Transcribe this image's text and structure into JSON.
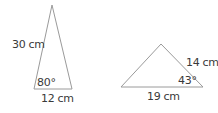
{
  "triangles": [
    {
      "id": "triangle-1",
      "side_label": "30 cm",
      "base_label": "12 cm",
      "angle_label": "80°",
      "vertices": [
        [
          52,
          5
        ],
        [
          34,
          89
        ],
        [
          72,
          89
        ]
      ]
    },
    {
      "id": "triangle-2",
      "side_label": "14 cm",
      "base_label": "19 cm",
      "angle_label": "43°",
      "vertices": [
        [
          161,
          44
        ],
        [
          121,
          87
        ],
        [
          203,
          87
        ]
      ]
    }
  ],
  "colors": {
    "stroke": "#9a9a9a",
    "text": "#3a3a3a",
    "background": "#ffffff"
  }
}
